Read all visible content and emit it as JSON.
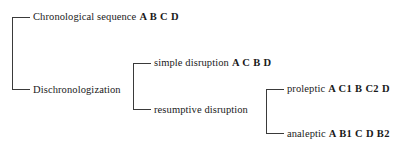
{
  "diagram": {
    "type": "tree",
    "orientation": "left-to-right",
    "line_color": "#3a3a3a",
    "background_color": "#ffffff",
    "text_color": "#1a1a1a",
    "nodes": [
      {
        "id": "chronological",
        "level": 1,
        "term": "Chronological sequence",
        "sequence": "A B C D",
        "x": 33,
        "y": 17
      },
      {
        "id": "dischronologization",
        "level": 1,
        "term": "Dischronologization",
        "sequence": "",
        "x": 33,
        "y": 90
      },
      {
        "id": "simple-disruption",
        "level": 2,
        "term": "simple disruption",
        "sequence": "A C B D",
        "x": 154,
        "y": 63
      },
      {
        "id": "resumptive-disruption",
        "level": 2,
        "term": "resumptive disruption",
        "sequence": "",
        "x": 154,
        "y": 110
      },
      {
        "id": "proleptic",
        "level": 3,
        "term": "proleptic",
        "sequence": "A C1 B C2 D",
        "x": 287,
        "y": 89
      },
      {
        "id": "analeptic",
        "level": 3,
        "term": "analeptic",
        "sequence": "A B1 C D B2",
        "x": 287,
        "y": 134
      }
    ],
    "brackets": [
      {
        "id": "bracket-root",
        "spine_x": 12,
        "top_y": 17,
        "bottom_y": 90,
        "tick_end_x": 30
      },
      {
        "id": "bracket-dischronologization",
        "spine_x": 133,
        "top_y": 63,
        "bottom_y": 110,
        "tick_end_x": 151
      },
      {
        "id": "bracket-resumptive",
        "spine_x": 266,
        "top_y": 89,
        "bottom_y": 134,
        "tick_end_x": 284
      }
    ]
  }
}
